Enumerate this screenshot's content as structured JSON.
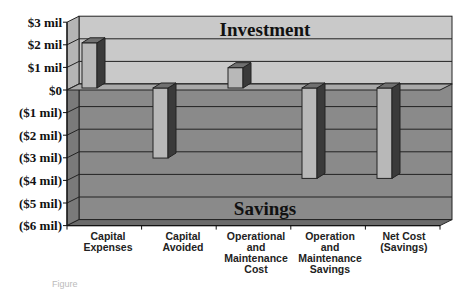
{
  "chart_data": {
    "type": "bar",
    "style": "3d-column",
    "title": "",
    "region_labels": {
      "upper": "Investment",
      "lower": "Savings"
    },
    "categories": [
      [
        "Capital",
        "Expenses"
      ],
      [
        "Capital",
        "Avoided"
      ],
      [
        "Operational",
        "and",
        "Maintenance",
        "Cost"
      ],
      [
        "Operation",
        "and",
        "Maintenance",
        "Savings"
      ],
      [
        "Net Cost",
        "(Savings)"
      ]
    ],
    "category_names": [
      "Capital Expenses",
      "Capital Avoided",
      "Operational and Maintenance Cost",
      "Operation and Maintenance Savings",
      "Net Cost (Savings)"
    ],
    "values": [
      2.0,
      -3.1,
      0.9,
      -4.0,
      -4.0
    ],
    "unit": "$ million",
    "xlabel": "",
    "ylabel": "",
    "ylim": [
      -6,
      3
    ],
    "yticks": [
      "$3 mil",
      "$2 mil",
      "$1 mil",
      "$0",
      "($1 mil)",
      "($2 mil)",
      "($3 mil)",
      "($4 mil)",
      "($5 mil)",
      "($6 mil)"
    ],
    "ytick_values": [
      3,
      2,
      1,
      0,
      -1,
      -2,
      -3,
      -4,
      -5,
      -6
    ],
    "grid": true,
    "legend": "none"
  },
  "colors": {
    "upper_wall": "#c9c9c9",
    "lower_wall": "#8a8a8a",
    "side_wall_upper": "#b5b5b5",
    "side_wall_lower": "#7a7a7a",
    "bar_front": "#b8b8b8",
    "bar_side": "#3a3a3a",
    "bar_top": "#707070",
    "gridline": "#222222"
  },
  "caption": "Figure"
}
